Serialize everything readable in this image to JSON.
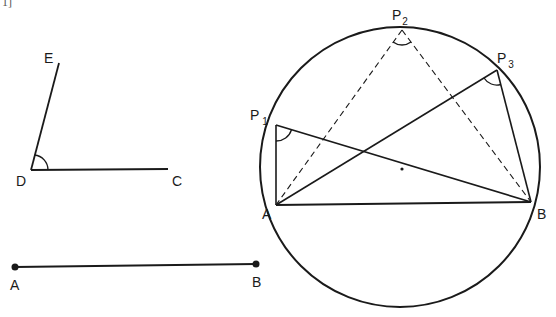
{
  "caption_fragment": "1]",
  "angle_figure": {
    "labels": {
      "E": "E",
      "D": "D",
      "C": "C"
    }
  },
  "segment_figure": {
    "labels": {
      "A": "A",
      "B": "B"
    }
  },
  "circle_figure": {
    "labels": {
      "P1": "P",
      "P1_sub": "1",
      "P2": "P",
      "P2_sub": "2",
      "P3": "P",
      "P3_sub": "3",
      "A": "A",
      "B": "B"
    },
    "description": "Points P1, P2, P3 on major arc of circle subtend equal angles over chord AB"
  },
  "colors": {
    "stroke": "#1a1a1a",
    "background": "#ffffff"
  }
}
